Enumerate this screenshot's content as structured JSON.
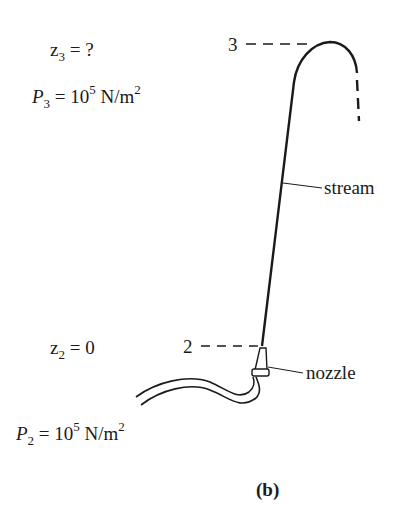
{
  "figure": {
    "caption": "(b)",
    "point3": {
      "marker": "3",
      "z_symbol": "z",
      "z_sub": "3",
      "z_eq": " = ?",
      "p_symbol": "P",
      "p_sub": "3",
      "p_eq": " = 10",
      "p_exp": "5",
      "p_unit": " N/m",
      "p_unit_exp": "2"
    },
    "point2": {
      "marker": "2",
      "z_symbol": "z",
      "z_sub": "2",
      "z_eq": " = 0",
      "p_symbol": "P",
      "p_sub": "2",
      "p_eq": " = 10",
      "p_exp": "5",
      "p_unit": " N/m",
      "p_unit_exp": "2"
    },
    "labels": {
      "stream": "stream",
      "nozzle": "nozzle"
    },
    "colors": {
      "ink": "#1a1a1a",
      "background": "#ffffff"
    }
  }
}
